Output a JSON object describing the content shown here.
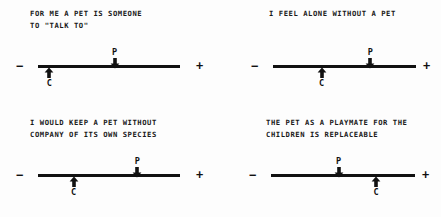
{
  "figure": {
    "kind": "semantic-differential-scales",
    "panel_count": 4,
    "pole_negative": "−",
    "pole_positive": "+",
    "marker_labels": {
      "p": "P",
      "c": "C"
    },
    "ink_color": "#111111",
    "background_color": "#fdfdfd"
  },
  "chart_data": {
    "type": "scatter",
    "title": "",
    "subtitle": "",
    "xlabel": "",
    "ylabel": "",
    "xlim": [
      0,
      100
    ],
    "grid": false,
    "legend": "none",
    "axis_endpoint_labels": {
      "left": "−",
      "right": "+"
    },
    "series": [
      {
        "name": "P",
        "values": [
          54,
          68,
          70,
          47
        ]
      },
      {
        "name": "C",
        "values": [
          8,
          34,
          25,
          73
        ]
      }
    ],
    "categories": [
      "FOR ME A PET IS SOMEONE TO \"TALK TO\"",
      "I FEEL ALONE WITHOUT A PET",
      "I WOULD KEEP A PET WITHOUT COMPANY OF ITS OWN SPECIES",
      "THE PET AS A PLAYMATE FOR THE CHILDREN IS REPLACEABLE"
    ]
  },
  "panels": [
    {
      "id": "panel-1",
      "caption": "FOR ME A PET IS SOMEONE\nTO \"TALK TO\"",
      "minus": "−",
      "plus": "+",
      "p_label": "P",
      "c_label": "C",
      "p_pos": 54,
      "c_pos": 8
    },
    {
      "id": "panel-2",
      "caption": "I FEEL ALONE WITHOUT A PET",
      "minus": "−",
      "plus": "+",
      "p_label": "P",
      "c_label": "C",
      "p_pos": 68,
      "c_pos": 34
    },
    {
      "id": "panel-3",
      "caption": "I WOULD KEEP A PET WITHOUT\nCOMPANY OF ITS OWN SPECIES",
      "minus": "−",
      "plus": "+",
      "p_label": "P",
      "c_label": "C",
      "p_pos": 70,
      "c_pos": 25
    },
    {
      "id": "panel-4",
      "caption": "THE PET AS A PLAYMATE FOR THE\nCHILDREN IS REPLACEABLE",
      "minus": "−",
      "plus": "+",
      "p_label": "P",
      "c_label": "C",
      "p_pos": 47,
      "c_pos": 73
    }
  ]
}
